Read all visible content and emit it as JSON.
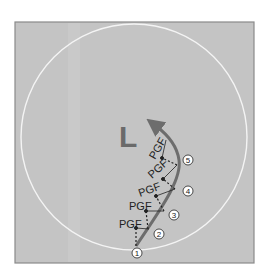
{
  "diagram": {
    "title_letter": "L",
    "colors": {
      "background": "#ffffff",
      "panel": "#c4c4c4",
      "panel_border": "#8a8a8a",
      "circle": "#f4f4f4",
      "path": "#6d6d6d",
      "letter": "#6a6a6a",
      "text": "#222222"
    },
    "force_label": "PGF",
    "pgf_labels": [
      "PGF",
      "PGF",
      "PGF",
      "PGF",
      "PGF"
    ],
    "points": [
      {
        "label": "1"
      },
      {
        "label": "2"
      },
      {
        "label": "3"
      },
      {
        "label": "4"
      },
      {
        "label": "5"
      }
    ]
  }
}
